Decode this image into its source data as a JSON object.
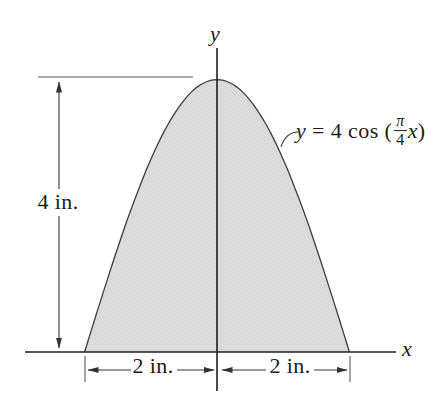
{
  "figure": {
    "labels": {
      "y_axis": "y",
      "x_axis": "x",
      "height_dim": "4 in.",
      "width_dim_left": "2 in.",
      "width_dim_right": "2 in."
    },
    "equation": {
      "lhs": "y",
      "mid": " = 4 cos (",
      "numerator": "π",
      "denominator": "4",
      "variable": "x",
      "close_paren": ")"
    },
    "colors": {
      "region_fill": "#dcdcdc",
      "region_dot": "#cbcbcb",
      "axis_line": "#1f1f1f",
      "curve_line": "#3d3d3d",
      "dim_line": "#333333",
      "light_line": "#5a5a5a"
    }
  },
  "chart_data": {
    "type": "area",
    "equation": "y = 4 cos((π/4)x)",
    "amplitude": 4,
    "angular_coefficient": 0.7853981633974483,
    "x_range": [
      -2,
      2
    ],
    "y_range": [
      0,
      4
    ],
    "x_units": "in.",
    "y_units": "in.",
    "annotations": [
      "height = 4 in.",
      "half-width left = 2 in.",
      "half-width right = 2 in."
    ],
    "axis_labels": {
      "x": "x",
      "y": "y"
    },
    "grid": false,
    "plot": {
      "origin_px": [
        217,
        352
      ],
      "scale_px": [
        66.2,
        68.1
      ]
    }
  }
}
